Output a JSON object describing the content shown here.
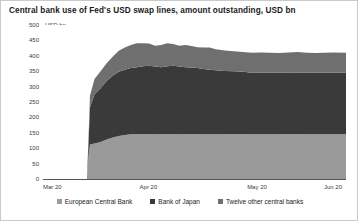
{
  "chart_data": {
    "type": "area",
    "title": "Central bank use of Fed's USD swap lines, amount outstanding, USD bn",
    "ylabel": "USD bn",
    "xlabel": "",
    "ylim": [
      0,
      500
    ],
    "yticks": [
      500,
      450,
      400,
      350,
      300,
      250,
      200,
      150,
      100,
      50,
      0
    ],
    "xtick_labels": [
      "Mar 20",
      "Apr 20",
      "May 20",
      "Jun 20"
    ],
    "xtick_positions": [
      0,
      0.355,
      0.71,
      1.0
    ],
    "grid": false,
    "legend_position": "bottom",
    "stacked": true,
    "colors": {
      "european_central_bank": "#9a9a9a",
      "bank_of_japan": "#3a3a3a",
      "twelve_other_central_banks": "#6f6f6f"
    },
    "x": [
      0.0,
      0.04,
      0.08,
      0.12,
      0.145,
      0.15,
      0.155,
      0.17,
      0.19,
      0.21,
      0.23,
      0.25,
      0.27,
      0.29,
      0.31,
      0.33,
      0.35,
      0.37,
      0.39,
      0.41,
      0.43,
      0.45,
      0.47,
      0.49,
      0.51,
      0.53,
      0.55,
      0.57,
      0.6,
      0.63,
      0.66,
      0.69,
      0.72,
      0.75,
      0.78,
      0.81,
      0.84,
      0.87,
      0.9,
      0.93,
      0.96,
      1.0
    ],
    "series": [
      {
        "name": "European Central Bank",
        "values": [
          0,
          0,
          0,
          0,
          0,
          75,
          112,
          115,
          120,
          128,
          135,
          140,
          143,
          145,
          145,
          146,
          146,
          145,
          145,
          146,
          146,
          145,
          145,
          146,
          146,
          145,
          145,
          145,
          145,
          146,
          146,
          145,
          145,
          145,
          145,
          146,
          146,
          145,
          145,
          145,
          145,
          145
        ]
      },
      {
        "name": "Bank of Japan",
        "values": [
          0,
          0,
          0,
          0,
          0,
          35,
          120,
          160,
          175,
          190,
          200,
          208,
          212,
          215,
          218,
          220,
          222,
          220,
          218,
          220,
          222,
          220,
          218,
          216,
          214,
          212,
          210,
          208,
          206,
          204,
          202,
          200,
          200,
          200,
          200,
          200,
          200,
          200,
          200,
          200,
          200,
          200
        ]
      },
      {
        "name": "Twelve other central banks",
        "values": [
          0,
          0,
          0,
          0,
          0,
          15,
          38,
          50,
          55,
          58,
          62,
          68,
          72,
          75,
          78,
          75,
          72,
          68,
          72,
          75,
          70,
          68,
          72,
          70,
          68,
          70,
          72,
          68,
          66,
          65,
          64,
          65,
          66,
          65,
          64,
          65,
          66,
          65,
          64,
          65,
          66,
          65
        ]
      }
    ]
  },
  "legend": {
    "items": [
      {
        "label": "European Central Bank",
        "color": "#9a9a9a"
      },
      {
        "label": "Bank of Japan",
        "color": "#3a3a3a"
      },
      {
        "label": "Twelve other central banks",
        "color": "#6f6f6f"
      }
    ]
  }
}
